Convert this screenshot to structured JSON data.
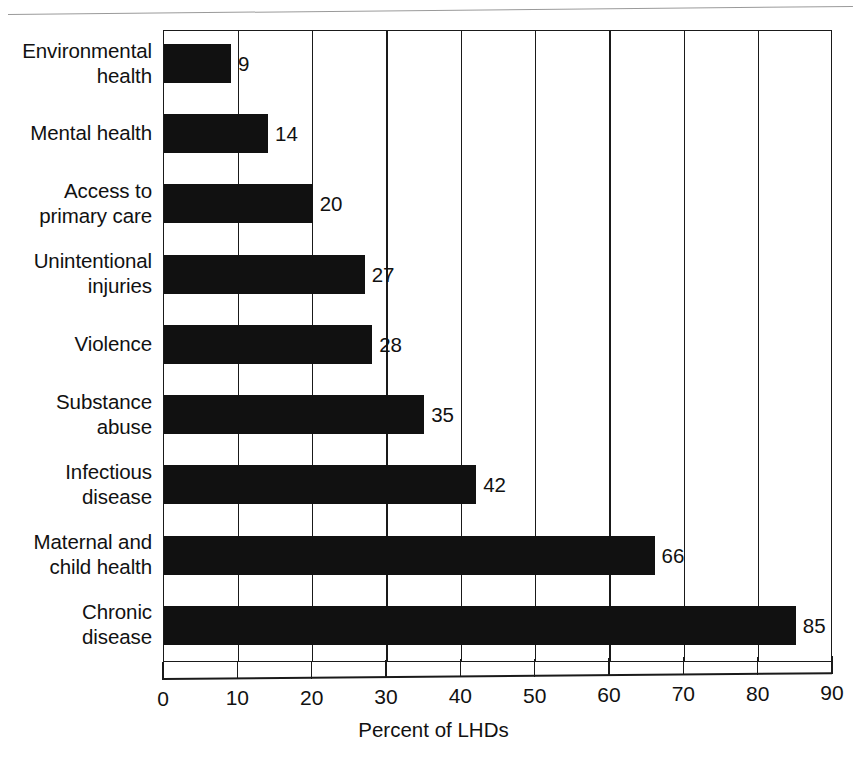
{
  "chart_data": {
    "type": "bar",
    "orientation": "horizontal",
    "title": "",
    "xlabel": "Percent of LHDs",
    "ylabel": "",
    "xlim": [
      0,
      90
    ],
    "xticks": [
      0,
      10,
      20,
      30,
      40,
      50,
      60,
      70,
      80,
      90
    ],
    "grid": true,
    "grid_axis": "x",
    "legend": false,
    "bar_color": "#111111",
    "categories": [
      "Environmental health",
      "Mental health",
      "Access to primary care",
      "Unintentional injuries",
      "Violence",
      "Substance abuse",
      "Infectious disease",
      "Maternal and child health",
      "Chronic disease"
    ],
    "values": [
      9,
      14,
      20,
      27,
      28,
      35,
      42,
      66,
      85
    ],
    "data_labels": [
      "9",
      "14",
      "20",
      "27",
      "28",
      "35",
      "42",
      "66",
      "85"
    ],
    "category_lines": [
      [
        "Environmental",
        "health"
      ],
      [
        "Mental health"
      ],
      [
        "Access to",
        "primary care"
      ],
      [
        "Unintentional",
        "injuries"
      ],
      [
        "Violence"
      ],
      [
        "Substance",
        "abuse"
      ],
      [
        "Infectious",
        "disease"
      ],
      [
        "Maternal and",
        "child health"
      ],
      [
        "Chronic",
        "disease"
      ]
    ]
  }
}
